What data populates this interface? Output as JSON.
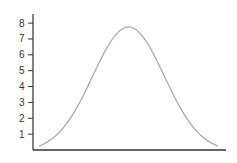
{
  "chart_data": {
    "type": "line",
    "title": "",
    "xlabel": "",
    "ylabel": "",
    "ylim": [
      0,
      8.5
    ],
    "yticks": [
      1,
      2,
      3,
      4,
      5,
      6,
      7,
      8
    ],
    "ytick_labels": [
      "1",
      "2",
      "3",
      "4",
      "5",
      "6",
      "7",
      "8"
    ],
    "xticks": [],
    "grid": false,
    "legend": null,
    "series": [
      {
        "name": "bell curve",
        "color": "#aaaaaa",
        "x": [
          0,
          0.1,
          0.2,
          0.3,
          0.4,
          0.5,
          0.6,
          0.7,
          0.8,
          0.9,
          1.0
        ],
        "values": [
          0.25,
          0.8,
          2.2,
          4.2,
          6.3,
          7.75,
          6.3,
          4.2,
          2.2,
          0.8,
          0.25
        ]
      }
    ]
  },
  "colors": {
    "axis": "#333333",
    "curve": "#aaaaaa"
  }
}
